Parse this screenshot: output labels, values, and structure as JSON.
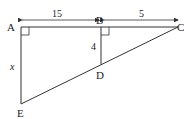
{
  "diagram": {
    "points": {
      "A": {
        "label": "A"
      },
      "B": {
        "label": "B"
      },
      "C": {
        "label": "C"
      },
      "D": {
        "label": "D"
      },
      "E": {
        "label": "E"
      }
    },
    "measurements": {
      "AB": "15",
      "BC": "5",
      "BD": "4",
      "AE": "x"
    },
    "right_angles": [
      "A",
      "B"
    ],
    "colors": {
      "line": "#333333",
      "background": "#ffffff"
    }
  }
}
